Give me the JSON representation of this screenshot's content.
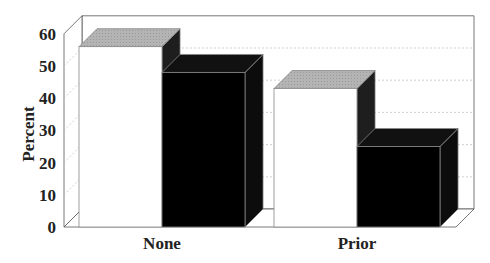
{
  "chart_data": {
    "type": "bar",
    "title": "",
    "xlabel": "",
    "ylabel": "Percent",
    "ylim": [
      0,
      60
    ],
    "yticks": [
      0,
      10,
      20,
      30,
      40,
      50,
      60
    ],
    "categories": [
      "None",
      "Prior"
    ],
    "series": [
      {
        "name": "Series 1 (white)",
        "color": "#ffffff",
        "values": [
          56,
          43
        ]
      },
      {
        "name": "Series 2 (black)",
        "color": "#000000",
        "values": [
          48,
          25
        ]
      }
    ],
    "style": "3d",
    "grid": "dotted horizontal on back wall",
    "legend": "none"
  }
}
